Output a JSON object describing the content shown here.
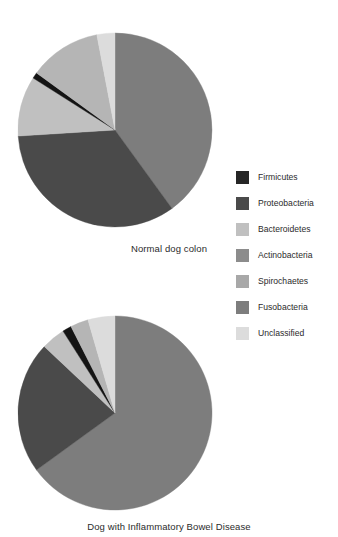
{
  "figure": {
    "background": "#ffffff",
    "width": 338,
    "height": 537
  },
  "captions": {
    "top": "Normal dog colon",
    "bottom": "Dog with Inflammatory Bowel Disease"
  },
  "legend": {
    "position": "right",
    "items": [
      {
        "label": "Firmicutes",
        "color": "#262626"
      },
      {
        "label": "Proteobacteria",
        "color": "#4a4a4a"
      },
      {
        "label": "Bacteroidetes",
        "color": "#c0c0c0"
      },
      {
        "label": "Actinobacteria",
        "color": "#8c8c8c"
      },
      {
        "label": "Spirochaetes",
        "color": "#a8a8a8"
      },
      {
        "label": "Fusobacteria",
        "color": "#7d7d7d"
      },
      {
        "label": "Unclassified",
        "color": "#dcdcdc"
      }
    ]
  },
  "chart_data": [
    {
      "type": "pie",
      "title": "Normal dog colon",
      "id": "normal-dog-colon",
      "center": [
        115,
        130
      ],
      "radius": 97,
      "start_angle": 0,
      "direction": "clockwise",
      "labels": [
        "Fusobacteria",
        "Proteobacteria",
        "Bacteroidetes",
        "Firmicutes",
        "Spirochaetes",
        "Unclassified"
      ],
      "values": [
        40.0,
        34.0,
        10.0,
        1.0,
        12.0,
        3.0
      ],
      "colors": [
        "#7d7d7d",
        "#4a4a4a",
        "#c0c0c0",
        "#141414",
        "#b5b5b5",
        "#dcdcdc"
      ],
      "units": "percent"
    },
    {
      "type": "pie",
      "title": "Dog with Inflammatory Bowel Disease",
      "id": "dog-with-ibd",
      "center": [
        115,
        413
      ],
      "radius": 97,
      "start_angle": 0,
      "direction": "clockwise",
      "labels": [
        "Fusobacteria",
        "Proteobacteria",
        "Bacteroidetes",
        "Firmicutes",
        "Spirochaetes",
        "Unclassified"
      ],
      "values": [
        65.0,
        22.0,
        4.0,
        1.5,
        3.0,
        4.5
      ],
      "colors": [
        "#7d7d7d",
        "#4a4a4a",
        "#c0c0c0",
        "#141414",
        "#b5b5b5",
        "#dcdcdc"
      ],
      "units": "percent"
    }
  ]
}
